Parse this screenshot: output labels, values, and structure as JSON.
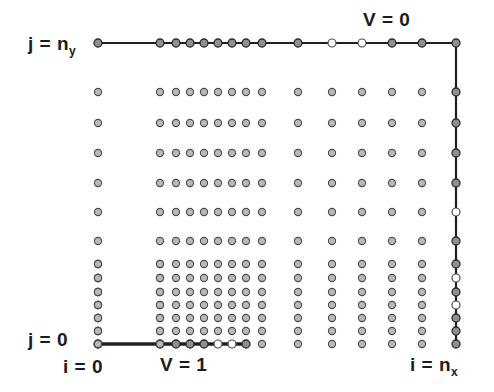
{
  "figure": {
    "width": 494,
    "height": 392,
    "background": "#ffffff"
  },
  "labels": {
    "top_left": {
      "text": "j = n",
      "sub": "y",
      "name": "j-equals-ny"
    },
    "top_right": {
      "text": "V = 0",
      "sub": "",
      "name": "v-equals-0"
    },
    "bottom_left": {
      "text": "j = 0",
      "sub": "",
      "name": "j-equals-0"
    },
    "bottom_i0": {
      "text": "i = 0",
      "sub": "",
      "name": "i-equals-0"
    },
    "bottom_v1": {
      "text": "V = 1",
      "sub": "",
      "name": "v-equals-1"
    },
    "bottom_right": {
      "text": "i = n",
      "sub": "x",
      "name": "i-equals-nx"
    }
  },
  "colors": {
    "node_fill": "#b9b9b9",
    "node_stroke": "#4a4a4a",
    "boundary_node_fill": "#8f8f8f",
    "boundary_node_stroke": "#2b2b2b",
    "edge": "#1f1f1f",
    "background": "#ffffff",
    "text": "#1c1c1c"
  },
  "chart_data": {
    "type": "scatter",
    "xlabel": "i",
    "ylabel": "j",
    "xlim": [
      0,
      494
    ],
    "ylim": [
      0,
      392
    ],
    "grid": false,
    "legend": null,
    "node_radius": 3.6,
    "boundary_node_radius": 4.0,
    "x_columns": [
      98,
      160,
      176,
      190,
      204,
      218,
      232,
      246,
      262,
      298,
      332,
      362,
      392,
      422,
      456
    ],
    "y_rows": [
      43,
      92,
      123,
      153,
      183,
      212,
      241,
      264,
      278,
      292,
      305,
      318,
      331,
      344
    ],
    "columns_dense_cluster": [
      176,
      190,
      204,
      218,
      232,
      246,
      262
    ],
    "rows_dense_cluster": [
      264,
      278,
      292,
      305,
      318,
      331,
      344
    ],
    "annotations": [
      {
        "text": "V = 0",
        "attach": "top-boundary",
        "x": 388,
        "y": 20
      },
      {
        "text": "V = 1",
        "attach": "bottom-left-boundary",
        "x": 185,
        "y": 364
      },
      {
        "text": "j = n_y",
        "attach": "top-row",
        "x": 50,
        "y": 43
      },
      {
        "text": "j = 0",
        "attach": "bottom-row",
        "x": 50,
        "y": 338
      },
      {
        "text": "i = 0",
        "attach": "left-column",
        "x": 85,
        "y": 366
      },
      {
        "text": "i = n_x",
        "attach": "right-column",
        "x": 432,
        "y": 364
      }
    ],
    "boundary_segments": [
      {
        "name": "top",
        "potential": "V = 0",
        "x1": 98,
        "y1": 43,
        "x2": 456,
        "y2": 43
      },
      {
        "name": "right",
        "potential": "V = 0",
        "x1": 456,
        "y1": 43,
        "x2": 456,
        "y2": 344
      },
      {
        "name": "bottom-left",
        "potential": "V = 1",
        "x1": 98,
        "y1": 344,
        "x2": 246,
        "y2": 344
      }
    ]
  }
}
